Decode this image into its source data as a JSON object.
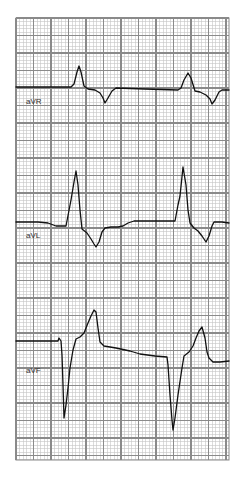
{
  "figure": {
    "width": 241,
    "height": 479,
    "background": "#ffffff",
    "grid": {
      "x": 16,
      "y": 18,
      "width": 213,
      "height": 442,
      "minor_spacing": 3.5,
      "major_spacing": 17.5,
      "minor_color": "#c4c4c4",
      "major_color": "#8a8a8a",
      "border_color": "#8a8a8a"
    },
    "trace_color": "#111111",
    "trace_width": 1.3
  },
  "leads": [
    {
      "name": "aVR",
      "label": "aVR",
      "label_pos": [
        26,
        104
      ],
      "points": [
        [
          16,
          87
        ],
        [
          71,
          87
        ],
        [
          74,
          84
        ],
        [
          77,
          72
        ],
        [
          79,
          66
        ],
        [
          81,
          72
        ],
        [
          84,
          86
        ],
        [
          88,
          89
        ],
        [
          95,
          90
        ],
        [
          100,
          93
        ],
        [
          103,
          98
        ],
        [
          105,
          103
        ],
        [
          108,
          98
        ],
        [
          112,
          91
        ],
        [
          116,
          88
        ],
        [
          145,
          89
        ],
        [
          178,
          90
        ],
        [
          181,
          88
        ],
        [
          184,
          80
        ],
        [
          188,
          73
        ],
        [
          191,
          78
        ],
        [
          195,
          91
        ],
        [
          200,
          92
        ],
        [
          206,
          95
        ],
        [
          210,
          99
        ],
        [
          212,
          104
        ],
        [
          215,
          100
        ],
        [
          219,
          92
        ],
        [
          222,
          90
        ],
        [
          229,
          90
        ]
      ]
    },
    {
      "name": "aVL",
      "label": "aVL",
      "label_pos": [
        26,
        238
      ],
      "points": [
        [
          16,
          222
        ],
        [
          38,
          222
        ],
        [
          48,
          223
        ],
        [
          56,
          226
        ],
        [
          66,
          226
        ],
        [
          71,
          200
        ],
        [
          74,
          182
        ],
        [
          76,
          171
        ],
        [
          78,
          185
        ],
        [
          80,
          210
        ],
        [
          82,
          229
        ],
        [
          87,
          233
        ],
        [
          91,
          239
        ],
        [
          94,
          244
        ],
        [
          96,
          247
        ],
        [
          99,
          242
        ],
        [
          102,
          232
        ],
        [
          105,
          228
        ],
        [
          111,
          227
        ],
        [
          118,
          227
        ],
        [
          123,
          226
        ],
        [
          128,
          223
        ],
        [
          134,
          221
        ],
        [
          150,
          221
        ],
        [
          168,
          221
        ],
        [
          175,
          221
        ],
        [
          178,
          205
        ],
        [
          180,
          196
        ],
        [
          183,
          167
        ],
        [
          186,
          185
        ],
        [
          188,
          210
        ],
        [
          190,
          223
        ],
        [
          194,
          228
        ],
        [
          198,
          231
        ],
        [
          202,
          236
        ],
        [
          206,
          242
        ],
        [
          209,
          236
        ],
        [
          212,
          226
        ],
        [
          214,
          222
        ],
        [
          222,
          222
        ],
        [
          229,
          223
        ]
      ]
    },
    {
      "name": "aVF",
      "label": "aVF",
      "label_pos": [
        26,
        373
      ],
      "points": [
        [
          16,
          341
        ],
        [
          58,
          341
        ],
        [
          59,
          338
        ],
        [
          61,
          341
        ],
        [
          62,
          355
        ],
        [
          63,
          385
        ],
        [
          64,
          418
        ],
        [
          66,
          405
        ],
        [
          68,
          388
        ],
        [
          70,
          368
        ],
        [
          73,
          350
        ],
        [
          76,
          339
        ],
        [
          80,
          337
        ],
        [
          84,
          333
        ],
        [
          88,
          323
        ],
        [
          91,
          316
        ],
        [
          94,
          310
        ],
        [
          96,
          312
        ],
        [
          98,
          328
        ],
        [
          100,
          342
        ],
        [
          104,
          346
        ],
        [
          110,
          347
        ],
        [
          116,
          348
        ],
        [
          130,
          351
        ],
        [
          140,
          354
        ],
        [
          155,
          356
        ],
        [
          167,
          357
        ],
        [
          168,
          365
        ],
        [
          170,
          395
        ],
        [
          172,
          420
        ],
        [
          173,
          430
        ],
        [
          175,
          418
        ],
        [
          178,
          395
        ],
        [
          182,
          368
        ],
        [
          184,
          356
        ],
        [
          189,
          352
        ],
        [
          193,
          346
        ],
        [
          196,
          338
        ],
        [
          199,
          331
        ],
        [
          202,
          327
        ],
        [
          205,
          338
        ],
        [
          207,
          352
        ],
        [
          209,
          358
        ],
        [
          213,
          362
        ],
        [
          220,
          362
        ],
        [
          229,
          361
        ]
      ]
    }
  ]
}
